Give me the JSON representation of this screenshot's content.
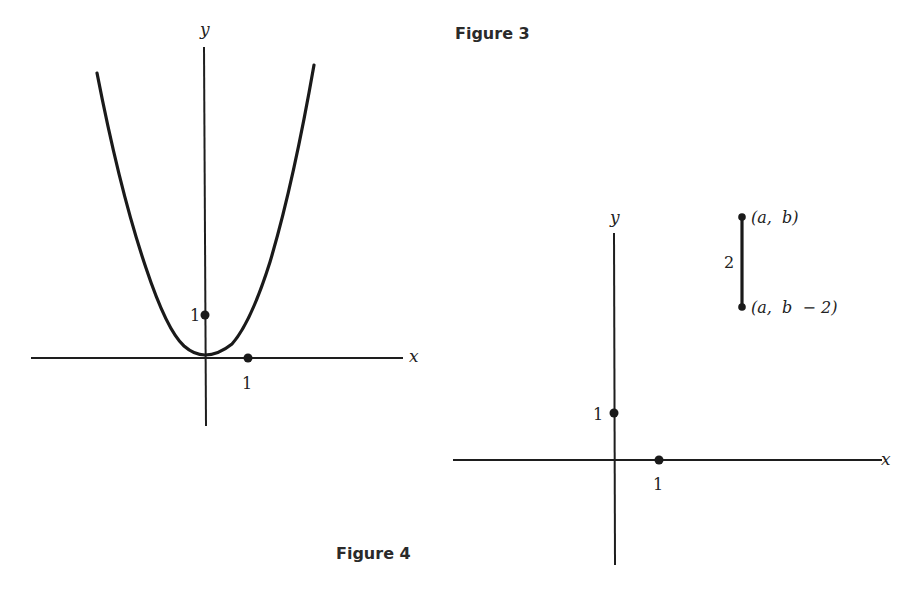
{
  "figure3": {
    "caption": "Figure 3",
    "x_axis_label": "x",
    "y_axis_label": "y",
    "tick_x": "1",
    "tick_y": "1",
    "curve": "parabola-like curve with minimum near origin (quartic-shaped, flat bottom)"
  },
  "figure4": {
    "caption": "Figure 4",
    "x_axis_label": "x",
    "y_axis_label": "y",
    "tick_x": "1",
    "tick_y": "1",
    "segment": {
      "top_label": "(a,  b)",
      "bottom_label": "(a,  b  − 2)",
      "length_label": "2"
    }
  },
  "colors": {
    "ink": "#1a1a1a",
    "background": "#ffffff"
  }
}
